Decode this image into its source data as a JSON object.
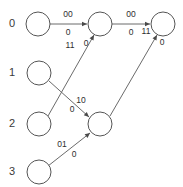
{
  "diagram": {
    "background_color": "#ffffff",
    "node_stroke_color": "#555555",
    "node_fill_color": "#ffffff",
    "edge_color": "#6b6b6b",
    "text_color": "#2e2e2e",
    "row_labels": [
      {
        "text": "0",
        "x": 12,
        "y": 24
      },
      {
        "text": "1",
        "x": 12,
        "y": 73
      },
      {
        "text": "2",
        "x": 12,
        "y": 124
      },
      {
        "text": "3",
        "x": 12,
        "y": 172
      }
    ],
    "nodes": [
      {
        "id": "n-r0-c0",
        "name": "state-0-start",
        "cx": 38,
        "cy": 24,
        "r": 12
      },
      {
        "id": "n-r0-c1",
        "name": "state-0-middle",
        "cx": 100,
        "cy": 24,
        "r": 12
      },
      {
        "id": "n-r0-c2",
        "name": "state-0-end",
        "cx": 163,
        "cy": 24,
        "r": 12
      },
      {
        "id": "n-r1-c0",
        "name": "state-1-start",
        "cx": 39,
        "cy": 73,
        "r": 12
      },
      {
        "id": "n-r2-c0",
        "name": "state-2-start",
        "cx": 39,
        "cy": 124,
        "r": 12
      },
      {
        "id": "n-r2-c1",
        "name": "state-2-middle",
        "cx": 100,
        "cy": 124,
        "r": 12
      },
      {
        "id": "n-r3-c0",
        "name": "state-3-start",
        "cx": 39,
        "cy": 172,
        "r": 12
      }
    ],
    "edges": [
      {
        "name": "edge-state0-to-state0-middle",
        "from": "n-r0-c0",
        "to": "n-r0-c1",
        "x1": 50,
        "y1": 24,
        "x2": 87,
        "y2": 24,
        "input": "00",
        "output": "0",
        "label_input_x": 68,
        "label_input_y": 15,
        "label_output_x": 68,
        "label_output_y": 33
      },
      {
        "name": "edge-state0-middle-to-state0-end",
        "from": "n-r0-c1",
        "to": "n-r0-c2",
        "x1": 112,
        "y1": 24,
        "x2": 150,
        "y2": 24,
        "input": "00",
        "output": "0",
        "label_input_x": 131,
        "label_input_y": 15,
        "label_output_x": 131,
        "label_output_y": 33
      },
      {
        "name": "edge-state2-to-state0-middle",
        "from": "n-r2-c0",
        "to": "n-r0-c1",
        "x1": 48,
        "y1": 116,
        "x2": 94,
        "y2": 35,
        "input": "11",
        "output": "0",
        "label_input_x": 70,
        "label_input_y": 46,
        "label_output_x": 86,
        "label_output_y": 44
      },
      {
        "name": "edge-state1-to-state2-middle",
        "from": "n-r1-c0",
        "to": "n-r2-c1",
        "x1": 49,
        "y1": 81,
        "x2": 89,
        "y2": 117,
        "input": "10",
        "output": "0",
        "label_input_x": 81,
        "label_input_y": 101,
        "label_output_x": 72,
        "label_output_y": 110
      },
      {
        "name": "edge-state3-to-state2-middle",
        "from": "n-r3-c0",
        "to": "n-r2-c1",
        "x1": 48,
        "y1": 166,
        "x2": 90,
        "y2": 133,
        "input": "01",
        "output": "0",
        "label_input_x": 62,
        "label_input_y": 145,
        "label_output_x": 74,
        "label_output_y": 155
      },
      {
        "name": "edge-state2-middle-to-state0-end",
        "from": "n-r2-c1",
        "to": "n-r0-c2",
        "x1": 110,
        "y1": 116,
        "x2": 157,
        "y2": 35,
        "input": "11",
        "output": "0",
        "label_input_x": 146,
        "label_input_y": 32,
        "label_output_x": 162,
        "label_output_y": 43
      }
    ]
  }
}
